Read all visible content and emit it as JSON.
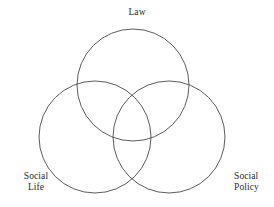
{
  "figure": {
    "type": "venn-diagram",
    "set_count": 3,
    "background_color": "#ffffff",
    "stroke_color": "#4a4a4a",
    "text_color": "#2b2b2b",
    "width": 274,
    "height": 207
  },
  "labels": {
    "top": "Law",
    "bottom_left": "Social\nLife",
    "bottom_right": "Social\nPolicy"
  },
  "chart_data": {
    "type": "venn",
    "title": "",
    "sets": [
      {
        "name": "Law",
        "label": "Law",
        "cx": 133,
        "cy": 85,
        "r": 56,
        "label_position": "top"
      },
      {
        "name": "Social Life",
        "label": "Social Life",
        "cx": 95,
        "cy": 137,
        "r": 56,
        "label_position": "bottom-left"
      },
      {
        "name": "Social Policy",
        "label": "Social Policy",
        "cx": 169,
        "cy": 137,
        "r": 56,
        "label_position": "bottom-right"
      }
    ],
    "regions": [],
    "grid": false,
    "legend": "none"
  }
}
